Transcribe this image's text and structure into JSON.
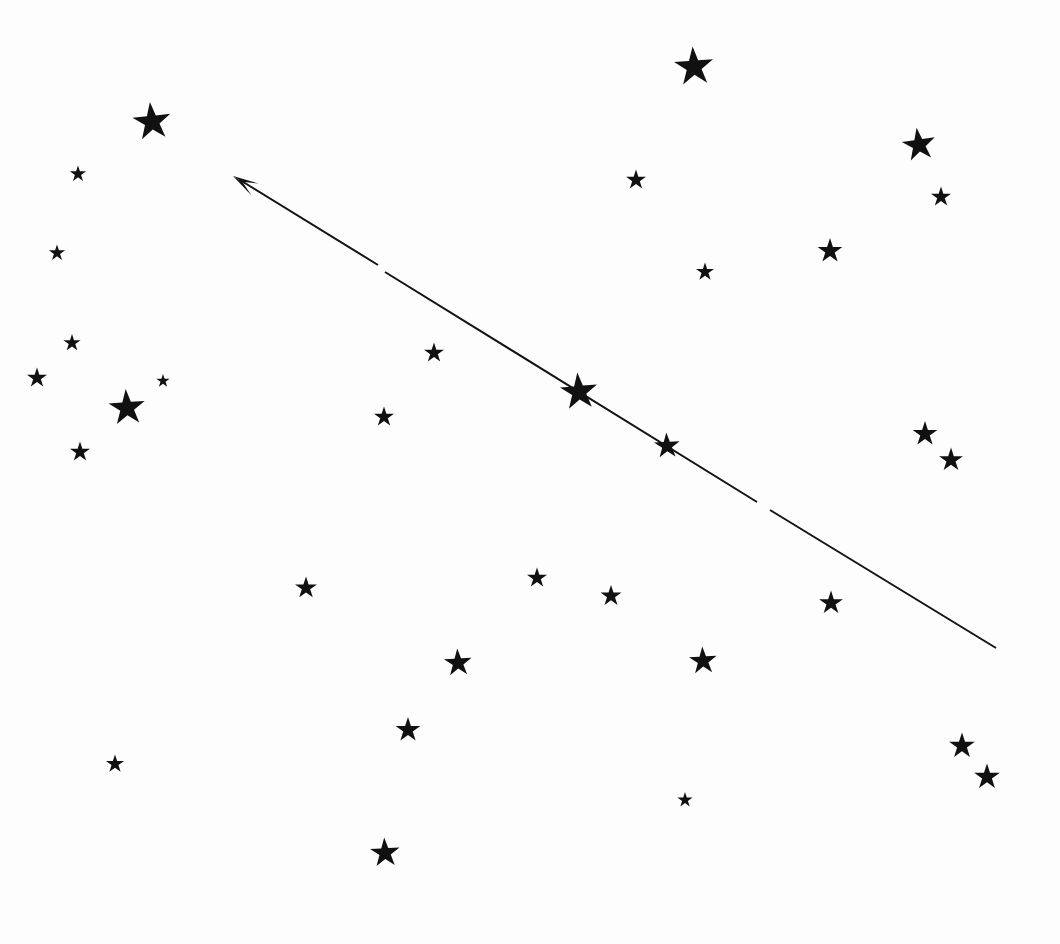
{
  "canvas": {
    "width": 1060,
    "height": 944,
    "background_color": "#fdfdfd",
    "ink_color": "#111111"
  },
  "chart_data": {
    "type": "scatter",
    "xlabel": "",
    "ylabel": "",
    "xlim": [
      0,
      1060
    ],
    "ylim": [
      0,
      944
    ],
    "grid": false,
    "legend": null,
    "marker": "star-5-point",
    "marker_color": "#111111",
    "points": [
      {
        "id": "s01",
        "x": 152,
        "y": 122,
        "size": 40,
        "rot": -6
      },
      {
        "id": "s02",
        "x": 78,
        "y": 174,
        "size": 17,
        "rot": 0
      },
      {
        "id": "s03",
        "x": 57,
        "y": 253,
        "size": 17,
        "rot": 0
      },
      {
        "id": "s04",
        "x": 72,
        "y": 343,
        "size": 18,
        "rot": 0
      },
      {
        "id": "s05",
        "x": 37,
        "y": 378,
        "size": 21,
        "rot": 0
      },
      {
        "id": "s06",
        "x": 163,
        "y": 381,
        "size": 14,
        "rot": 0
      },
      {
        "id": "s07",
        "x": 127,
        "y": 408,
        "size": 38,
        "rot": -4
      },
      {
        "id": "s08",
        "x": 80,
        "y": 452,
        "size": 21,
        "rot": 0
      },
      {
        "id": "s09",
        "x": 434,
        "y": 353,
        "size": 21,
        "rot": 0
      },
      {
        "id": "s10",
        "x": 384,
        "y": 417,
        "size": 21,
        "rot": 0
      },
      {
        "id": "s11",
        "x": 579,
        "y": 392,
        "size": 39,
        "rot": -5
      },
      {
        "id": "s12",
        "x": 667,
        "y": 446,
        "size": 27,
        "rot": -3
      },
      {
        "id": "s13",
        "x": 694,
        "y": 67,
        "size": 41,
        "rot": -4
      },
      {
        "id": "s14",
        "x": 636,
        "y": 180,
        "size": 21,
        "rot": 0
      },
      {
        "id": "s15",
        "x": 919,
        "y": 145,
        "size": 35,
        "rot": -8
      },
      {
        "id": "s16",
        "x": 941,
        "y": 197,
        "size": 21,
        "rot": 0
      },
      {
        "id": "s17",
        "x": 830,
        "y": 251,
        "size": 26,
        "rot": 0
      },
      {
        "id": "s18",
        "x": 705,
        "y": 272,
        "size": 19,
        "rot": 0
      },
      {
        "id": "s19",
        "x": 925,
        "y": 434,
        "size": 26,
        "rot": 0
      },
      {
        "id": "s20",
        "x": 951,
        "y": 460,
        "size": 25,
        "rot": 0
      },
      {
        "id": "s21",
        "x": 306,
        "y": 588,
        "size": 23,
        "rot": 0
      },
      {
        "id": "s22",
        "x": 537,
        "y": 578,
        "size": 21,
        "rot": 0
      },
      {
        "id": "s23",
        "x": 611,
        "y": 596,
        "size": 22,
        "rot": 0
      },
      {
        "id": "s24",
        "x": 831,
        "y": 603,
        "size": 25,
        "rot": 0
      },
      {
        "id": "s25",
        "x": 458,
        "y": 663,
        "size": 29,
        "rot": -3
      },
      {
        "id": "s26",
        "x": 703,
        "y": 661,
        "size": 29,
        "rot": -3
      },
      {
        "id": "s27",
        "x": 408,
        "y": 730,
        "size": 26,
        "rot": 0
      },
      {
        "id": "s28",
        "x": 115,
        "y": 764,
        "size": 19,
        "rot": 0
      },
      {
        "id": "s29",
        "x": 962,
        "y": 746,
        "size": 27,
        "rot": 0
      },
      {
        "id": "s30",
        "x": 987,
        "y": 777,
        "size": 27,
        "rot": 0
      },
      {
        "id": "s31",
        "x": 685,
        "y": 800,
        "size": 16,
        "rot": 0
      },
      {
        "id": "s32",
        "x": 385,
        "y": 853,
        "size": 31,
        "rot": -3
      }
    ],
    "annotations": [
      {
        "id": "motion-vector",
        "type": "arrow",
        "direction": "up-left",
        "tip": {
          "x": 233,
          "y": 176
        },
        "tail": {
          "x": 996,
          "y": 648
        },
        "stroke_width": 2,
        "broken": true,
        "segments": [
          {
            "x1": 240,
            "y1": 180,
            "x2": 378,
            "y2": 265
          },
          {
            "x1": 385,
            "y1": 272,
            "x2": 757,
            "y2": 502
          },
          {
            "x1": 770,
            "y1": 510,
            "x2": 996,
            "y2": 648
          }
        ],
        "arrowhead": {
          "length": 26,
          "half_width": 7
        }
      }
    ]
  }
}
